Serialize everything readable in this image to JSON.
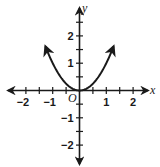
{
  "chart_data": {
    "type": "line",
    "title": "",
    "xlabel": "x",
    "ylabel": "y",
    "origin_label": "O",
    "function": "y = x^2",
    "xlim": [
      -2.5,
      2.5
    ],
    "ylim": [
      -2.7,
      2.8
    ],
    "x_ticks": [
      -2,
      -1.5,
      -1,
      -0.5,
      0,
      0.5,
      1,
      1.5,
      2
    ],
    "y_ticks": [
      -2.5,
      -2,
      -1.5,
      -1,
      -0.5,
      0,
      0.5,
      1,
      1.5,
      2,
      2.5
    ],
    "x_tick_labels": [
      "-2",
      "-1",
      "1",
      "2"
    ],
    "y_tick_labels": [
      "2",
      "1",
      "-1",
      "-2"
    ],
    "grid": false,
    "legend": null,
    "series": [
      {
        "name": "y = x^2",
        "x": [
          -1.25,
          -1.0,
          -0.75,
          -0.5,
          -0.25,
          0,
          0.25,
          0.5,
          0.75,
          1.0,
          1.25
        ],
        "y": [
          1.5625,
          1.0,
          0.5625,
          0.25,
          0.0625,
          0,
          0.0625,
          0.25,
          0.5625,
          1.0,
          1.5625
        ],
        "arrows_at_ends": true,
        "color": "#1a1a1a"
      }
    ]
  },
  "style": {
    "axis_color": "#1a1a1a",
    "curve_color": "#1a1a1a",
    "background": "#ffffff"
  }
}
